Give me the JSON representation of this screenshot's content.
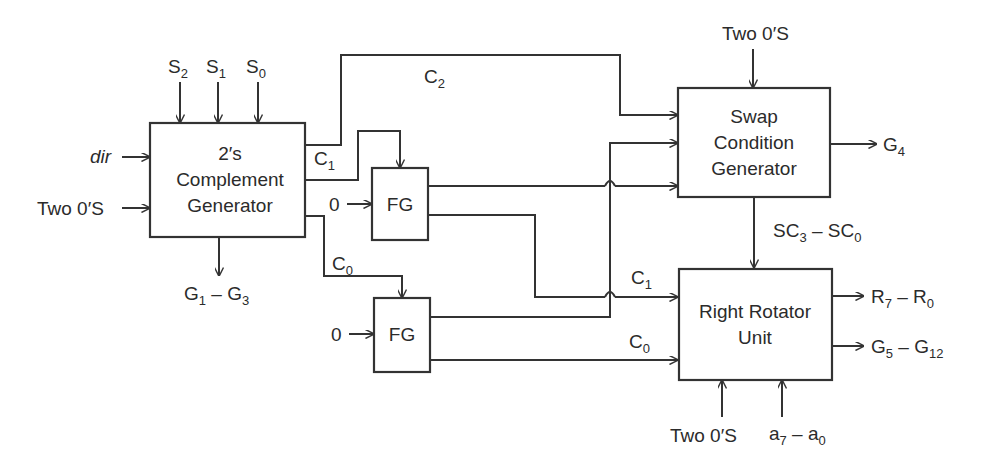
{
  "diagram": {
    "type": "block-diagram",
    "blocks": {
      "twos_complement": {
        "line1": "2′s",
        "line2": "Complement",
        "line3": "Generator"
      },
      "fg_top": {
        "label": "FG"
      },
      "fg_bottom": {
        "label": "FG"
      },
      "swap_condition": {
        "line1": "Swap",
        "line2": "Condition",
        "line3": "Generator"
      },
      "right_rotator": {
        "line1": "Right Rotator",
        "line2": "Unit"
      }
    },
    "inputs": {
      "s2": {
        "base": "S",
        "sub": "2"
      },
      "s1": {
        "base": "S",
        "sub": "1"
      },
      "s0": {
        "base": "S",
        "sub": "0"
      },
      "dir": "dir",
      "two_zeros_left": "Two 0′S",
      "zero_fg_top": "0",
      "zero_fg_bottom": "0",
      "two_zeros_swap": "Two 0′S",
      "two_zeros_rotator": "Two 0′S",
      "a_range": {
        "a": "a",
        "s1": "7",
        "dash": " – ",
        "b": "a",
        "s2": "0"
      }
    },
    "signals": {
      "c2": {
        "base": "C",
        "sub": "2"
      },
      "c1_left": {
        "base": "C",
        "sub": "1"
      },
      "c0_left": {
        "base": "C",
        "sub": "0"
      },
      "c1_right": {
        "base": "C",
        "sub": "1"
      },
      "c0_right": {
        "base": "C",
        "sub": "0"
      },
      "sc_range": {
        "a": "SC",
        "s1": "3",
        "dash": " – ",
        "b": "SC",
        "s2": "0"
      }
    },
    "outputs": {
      "g1_g3": {
        "a": "G",
        "s1": "1",
        "dash": " – ",
        "b": "G",
        "s2": "3"
      },
      "g4": {
        "base": "G",
        "sub": "4"
      },
      "r_range": {
        "a": "R",
        "s1": "7",
        "dash": " – ",
        "b": "R",
        "s2": "0"
      },
      "g5_g12": {
        "a": "G",
        "s1": "5",
        "dash": " – ",
        "b": "G",
        "s2": "12"
      }
    }
  }
}
